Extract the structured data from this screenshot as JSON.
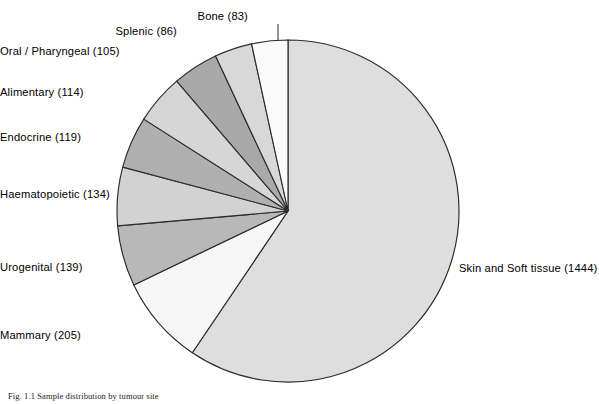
{
  "figure": {
    "caption": "Fig. 1.1 Sample distribution by tumour site",
    "background_color": "#ffffff",
    "outline_color": "#2b2b2b"
  },
  "chart_data": {
    "type": "pie",
    "title": "",
    "xlabel": "",
    "ylabel": "",
    "total": 2429,
    "start_angle_deg": 0,
    "direction": "clockwise",
    "center": {
      "x": 288,
      "y": 211
    },
    "radius": 171,
    "legend_position": "outside-labels",
    "grid": false,
    "categories": [
      "Skin and Soft tissue",
      "Mammary",
      "Urogenital",
      "Haematopoietic",
      "Endocrine",
      "Alimentary",
      "Oral / Pharyngeal",
      "Splenic",
      "Bone"
    ],
    "values": [
      1444,
      205,
      139,
      134,
      119,
      114,
      105,
      86,
      83
    ],
    "slices": [
      {
        "label": "Skin and Soft tissue",
        "value": 1444,
        "display": "Skin and Soft tissue  (1444)",
        "color": "#dedede",
        "label_x": 459,
        "label_y": 262,
        "align": "left"
      },
      {
        "label": "Mammary",
        "value": 205,
        "display": "Mammary  (205)",
        "color": "#f6f6f6",
        "label_x": 78,
        "label_y": 329,
        "align": "right"
      },
      {
        "label": "Urogenital",
        "value": 139,
        "display": "Urogenital  (139)",
        "color": "#b8b8b8",
        "label_x": 50,
        "label_y": 261,
        "align": "right"
      },
      {
        "label": "Haematopoietic",
        "value": 134,
        "display": "Haematopoietic  (134)",
        "color": "#d2d2d2",
        "label_x": 12,
        "label_y": 188,
        "align": "right"
      },
      {
        "label": "Endocrine",
        "value": 119,
        "display": "Endocrine  (119)",
        "color": "#b0b0b0",
        "label_x": 46,
        "label_y": 131,
        "align": "right"
      },
      {
        "label": "Alimentary",
        "value": 114,
        "display": "Alimentary  (114)",
        "color": "#d6d6d6",
        "label_x": 70,
        "label_y": 86,
        "align": "right"
      },
      {
        "label": "Oral / Pharyngeal",
        "value": 105,
        "display": "Oral / Pharyngeal  (105)",
        "color": "#a9a9a9",
        "label_x": 82,
        "label_y": 45,
        "align": "right"
      },
      {
        "label": "Splenic",
        "value": 86,
        "display": "Splenic  (86)",
        "color": "#d8d8d8",
        "label_x": 177,
        "label_y": 25,
        "align": "right"
      },
      {
        "label": "Bone",
        "value": 83,
        "display": "Bone  (83)",
        "color": "#fafafa",
        "label_x": 248,
        "label_y": 10,
        "align": "right"
      }
    ]
  }
}
